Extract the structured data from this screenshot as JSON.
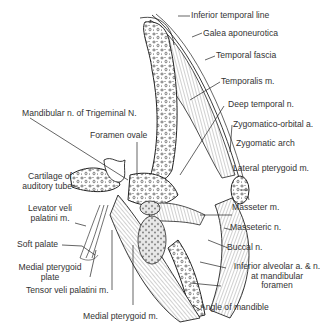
{
  "diagram": {
    "labels_right": [
      {
        "id": "inferior-temporal-line",
        "text": "Inferior temporal line"
      },
      {
        "id": "galea-aponeurotica",
        "text": "Galea aponeurotica"
      },
      {
        "id": "temporal-fascia",
        "text": "Temporal fascia"
      },
      {
        "id": "temporalis",
        "text": "Temporalis m."
      },
      {
        "id": "deep-temporal-n",
        "text": "Deep temporal n."
      },
      {
        "id": "zygomatico-orbital-a",
        "text": "Zygomatico-orbital a."
      },
      {
        "id": "zygomatic-arch",
        "text": "Zygomatic arch"
      },
      {
        "id": "lateral-pterygoid",
        "text": "Lateral pterygoid m."
      },
      {
        "id": "masseter",
        "text": "Masseter m."
      },
      {
        "id": "masseteric-n",
        "text": "Masseteric n."
      },
      {
        "id": "buccal-n",
        "text": "Buccal n."
      },
      {
        "id": "inferior-alveolar-1",
        "text": "Inferior alveolar a. & n."
      },
      {
        "id": "inferior-alveolar-2",
        "text": "at mandibular"
      },
      {
        "id": "inferior-alveolar-3",
        "text": "foramen"
      }
    ],
    "labels_left": [
      {
        "id": "mandibular-n",
        "text": "Mandibular n. of Trigeminal N."
      },
      {
        "id": "foramen-ovale",
        "text": "Foramen ovale"
      },
      {
        "id": "cartilage-1",
        "text": "Cartilage of"
      },
      {
        "id": "cartilage-2",
        "text": "auditory tube"
      },
      {
        "id": "levator-1",
        "text": "Levator veli"
      },
      {
        "id": "levator-2",
        "text": "palatini m."
      },
      {
        "id": "soft-palate",
        "text": "Soft palate"
      },
      {
        "id": "medial-plate-1",
        "text": "Medial pterygoid"
      },
      {
        "id": "medial-plate-2",
        "text": "plate"
      },
      {
        "id": "tensor",
        "text": "Tensor veli palatini m."
      }
    ],
    "labels_bottom": [
      {
        "id": "medial-pterygoid",
        "text": "Medial pterygoid m."
      },
      {
        "id": "angle-of-mandible",
        "text": "Angle of mandible"
      }
    ]
  }
}
